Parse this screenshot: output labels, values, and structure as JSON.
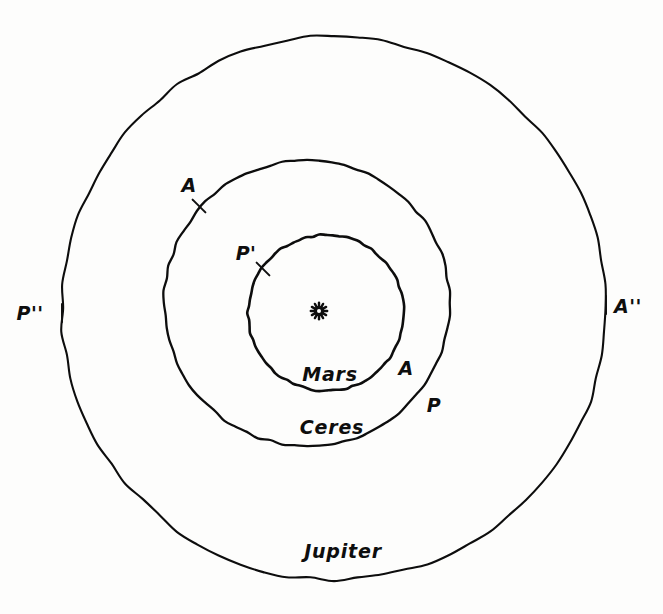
{
  "figure": {
    "background_color": "#fdfdfc",
    "ink_color": "#0d0d0d"
  },
  "center_body": {
    "name": "sun-symbol",
    "glyph": "radiating-star",
    "x": 319,
    "y": 311
  },
  "orbits": [
    {
      "id": "mars",
      "label": "Mars",
      "label_x": 330,
      "label_y": 375,
      "cx": 326,
      "cy": 313,
      "r": 78,
      "stroke_width": 2.6
    },
    {
      "id": "ceres",
      "label": "Ceres",
      "label_x": 332,
      "label_y": 428,
      "cx": 307,
      "cy": 303,
      "r": 143,
      "stroke_width": 2.3
    },
    {
      "id": "jupiter",
      "label": "Jupiter",
      "label_x": 343,
      "label_y": 552,
      "cx": 334,
      "cy": 308,
      "r": 272,
      "stroke_width": 2.1
    }
  ],
  "apsis_markers": [
    {
      "id": "mars-aphelion",
      "label": "A",
      "orbit": "mars",
      "label_x": 406,
      "label_y": 369,
      "tick_x": 391,
      "tick_y": 373,
      "tick_angle": 40,
      "has_tick": false
    },
    {
      "id": "mars-perihelion",
      "label": "P'",
      "orbit": "ceres",
      "label_x": 246,
      "label_y": 254,
      "tick_x": 263,
      "tick_y": 269,
      "tick_angle": 45,
      "has_tick": true
    },
    {
      "id": "ceres-perihelion",
      "label": "P",
      "orbit": "ceres",
      "label_x": 434,
      "label_y": 406,
      "tick_x": 420,
      "tick_y": 400,
      "tick_angle": 40,
      "has_tick": false
    },
    {
      "id": "ceres-aphelion",
      "label": "A",
      "orbit": "ceres",
      "label_x": 189,
      "label_y": 186,
      "tick_x": 199,
      "tick_y": 206,
      "tick_angle": 45,
      "has_tick": true
    },
    {
      "id": "jupiter-perihelion",
      "label": "P''",
      "orbit": "jupiter",
      "label_x": 30,
      "label_y": 314,
      "tick_x": 62,
      "tick_y": 313,
      "tick_angle": 90,
      "has_tick": true
    },
    {
      "id": "jupiter-aphelion",
      "label": "A''",
      "orbit": "jupiter",
      "label_x": 628,
      "label_y": 307,
      "tick_x": 606,
      "tick_y": 305,
      "tick_angle": 90,
      "has_tick": true
    }
  ]
}
